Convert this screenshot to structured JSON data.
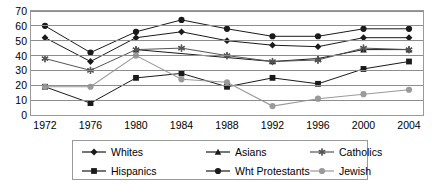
{
  "chart_data": {
    "type": "line",
    "title": "",
    "xlabel": "",
    "ylabel": "",
    "categories": [
      "1972",
      "1976",
      "1980",
      "1984",
      "1988",
      "1992",
      "1996",
      "2000",
      "2004"
    ],
    "ylim": [
      0,
      70
    ],
    "yticks": [
      0,
      10,
      20,
      30,
      40,
      50,
      60,
      70
    ],
    "grid": true,
    "legend_position": "bottom",
    "series": [
      {
        "name": "Whites",
        "marker": "diamond",
        "color": "#1a1a1a",
        "values": [
          52,
          36,
          52,
          56,
          50,
          47,
          46,
          52,
          52
        ]
      },
      {
        "name": "Asians",
        "marker": "triangle",
        "color": "#1a1a1a",
        "values": [
          null,
          null,
          44,
          null,
          null,
          36,
          38,
          44,
          44
        ]
      },
      {
        "name": "Catholics",
        "marker": "asterisk",
        "color": "#555555",
        "values": [
          38,
          30,
          44,
          45,
          40,
          36,
          37,
          45,
          44
        ]
      },
      {
        "name": "Hispanics",
        "marker": "square",
        "color": "#1a1a1a",
        "values": [
          19,
          8,
          25,
          28,
          19,
          25,
          21,
          31,
          36
        ]
      },
      {
        "name": "Wht Protestants",
        "marker": "circle",
        "color": "#1a1a1a",
        "values": [
          60,
          42,
          56,
          64,
          58,
          53,
          53,
          58,
          58
        ]
      },
      {
        "name": "Jewish",
        "marker": "circle-gray",
        "color": "#9a9a9a",
        "values": [
          19,
          19,
          40,
          24,
          22,
          6,
          11,
          14,
          17
        ]
      }
    ]
  },
  "legend": {
    "entries": [
      {
        "label": "Whites",
        "marker": "diamond",
        "color": "#1a1a1a"
      },
      {
        "label": "Asians",
        "marker": "triangle",
        "color": "#1a1a1a"
      },
      {
        "label": "Catholics",
        "marker": "asterisk",
        "color": "#555555"
      },
      {
        "label": "Hispanics",
        "marker": "square",
        "color": "#1a1a1a"
      },
      {
        "label": "Wht Protestants",
        "marker": "circle",
        "color": "#1a1a1a"
      },
      {
        "label": "Jewish",
        "marker": "circle-gray",
        "color": "#9a9a9a"
      }
    ]
  }
}
